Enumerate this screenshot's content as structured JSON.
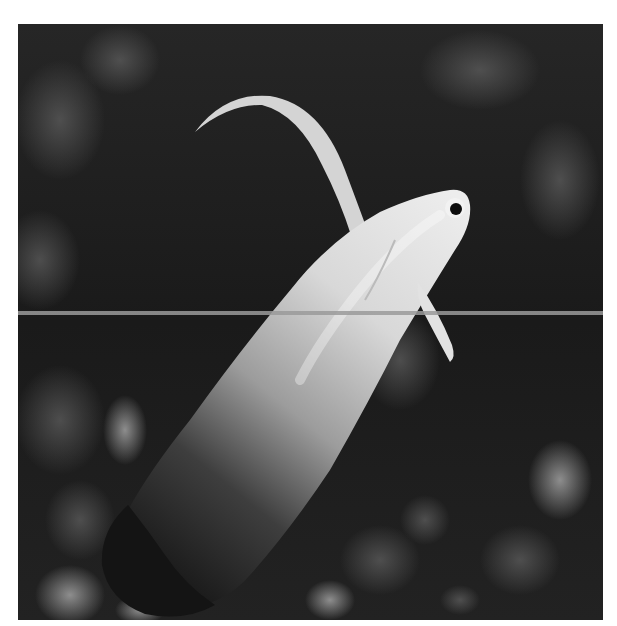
{
  "image": {
    "subject": "fish",
    "description": "Grayscale photograph of a firefish goby swimming diagonally upward against a dark, blurred reef background",
    "colors": {
      "page_background": "#ffffff",
      "photo_background": "#1c1c1c",
      "divider_line": "#9a9a9a",
      "fish_head": "#e6e6e6",
      "fish_tail": "#1a1a1a"
    },
    "frame": {
      "x": 18,
      "y": 24,
      "width": 585,
      "height": 596
    },
    "divider_line_y": 313
  }
}
